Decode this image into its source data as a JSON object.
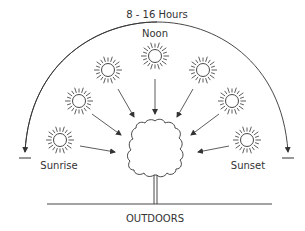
{
  "diagram": {
    "duration_label": "8 - 16 Hours",
    "labels": {
      "noon": "Noon",
      "sunrise": "Sunrise",
      "sunset": "Sunset",
      "setting": "OUTDOORS"
    },
    "sun_positions": [
      {
        "name": "sunrise",
        "cx": 60,
        "cy": 140
      },
      {
        "name": "morning-low",
        "cx": 79,
        "cy": 101
      },
      {
        "name": "morning-high",
        "cx": 108,
        "cy": 70
      },
      {
        "name": "noon",
        "cx": 155,
        "cy": 56
      },
      {
        "name": "afternoon-high",
        "cx": 203,
        "cy": 70
      },
      {
        "name": "afternoon-low",
        "cx": 232,
        "cy": 101
      },
      {
        "name": "sunset",
        "cx": 247,
        "cy": 140
      }
    ],
    "colors": {
      "stroke": "#333333",
      "background": "#ffffff"
    }
  }
}
